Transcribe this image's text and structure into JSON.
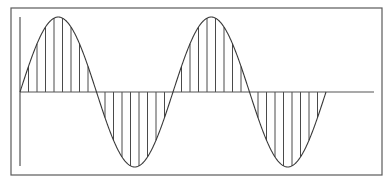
{
  "figure": {
    "type": "sine-wave-diagram",
    "colors": {
      "background": "#ffffff",
      "frame": "#5a5a5a",
      "axis": "#555555",
      "curve": "#3a3a3a",
      "hatch": "#4a4a4a"
    }
  },
  "chart_data": {
    "type": "line",
    "title": "",
    "xlabel": "",
    "ylabel": "",
    "function": "y = sin(x)",
    "periods": 2,
    "amplitude": 1,
    "grid": false,
    "hatch": {
      "style": "vertical lines between curve and x-axis",
      "lines_per_half_period": 9
    },
    "layout": {
      "frame": {
        "x": 11,
        "y": 8,
        "width": 371,
        "height": 167
      },
      "x_axis": {
        "y": 92,
        "x_start": 20,
        "x_end": 374
      },
      "y_axis": {
        "x": 20,
        "y_start": 17,
        "y_end": 166
      },
      "wave": {
        "x_start": 20,
        "period_px": 153,
        "amplitude_px": 75,
        "baseline_y": 92
      }
    }
  }
}
